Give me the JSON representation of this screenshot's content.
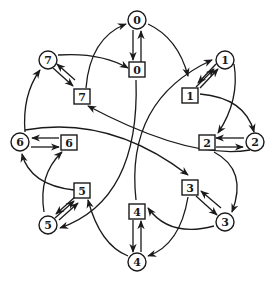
{
  "diagram": {
    "type": "state-transition-graph",
    "circle_nodes": [
      {
        "id": "c0",
        "label": "0"
      },
      {
        "id": "c1",
        "label": "1"
      },
      {
        "id": "c2",
        "label": "2"
      },
      {
        "id": "c3",
        "label": "3"
      },
      {
        "id": "c4",
        "label": "4"
      },
      {
        "id": "c5",
        "label": "5"
      },
      {
        "id": "c6",
        "label": "6"
      },
      {
        "id": "c7",
        "label": "7"
      }
    ],
    "square_nodes": [
      {
        "id": "s0",
        "label": "0"
      },
      {
        "id": "s1",
        "label": "1"
      },
      {
        "id": "s2",
        "label": "2"
      },
      {
        "id": "s3",
        "label": "3"
      },
      {
        "id": "s4",
        "label": "4"
      },
      {
        "id": "s5",
        "label": "5"
      },
      {
        "id": "s6",
        "label": "6"
      },
      {
        "id": "s7",
        "label": "7"
      }
    ],
    "edges": [
      {
        "from": "c0",
        "to": "s0"
      },
      {
        "from": "s0",
        "to": "c0"
      },
      {
        "from": "c1",
        "to": "s1"
      },
      {
        "from": "s1",
        "to": "c1"
      },
      {
        "from": "c2",
        "to": "s2"
      },
      {
        "from": "s2",
        "to": "c2"
      },
      {
        "from": "c3",
        "to": "s3"
      },
      {
        "from": "s3",
        "to": "c3"
      },
      {
        "from": "c4",
        "to": "s4"
      },
      {
        "from": "s4",
        "to": "c4"
      },
      {
        "from": "c5",
        "to": "s5"
      },
      {
        "from": "s5",
        "to": "c5"
      },
      {
        "from": "c6",
        "to": "s6"
      },
      {
        "from": "s6",
        "to": "c6"
      },
      {
        "from": "c7",
        "to": "s7"
      },
      {
        "from": "s7",
        "to": "c7"
      },
      {
        "from": "c0",
        "to": "s1"
      },
      {
        "from": "s7",
        "to": "c0"
      },
      {
        "from": "c7",
        "to": "s0"
      },
      {
        "from": "c1",
        "to": "s2"
      },
      {
        "from": "s1",
        "to": "c2"
      },
      {
        "from": "s2",
        "to": "c3"
      },
      {
        "from": "c3",
        "to": "s4"
      },
      {
        "from": "s3",
        "to": "c4"
      },
      {
        "from": "c4",
        "to": "s5"
      },
      {
        "from": "s5",
        "to": "c6"
      },
      {
        "from": "c5",
        "to": "s6"
      },
      {
        "from": "c6",
        "to": "s7"
      },
      {
        "from": "s0",
        "to": "c5"
      },
      {
        "from": "s4",
        "to": "c1"
      },
      {
        "from": "c2",
        "to": "s7"
      },
      {
        "from": "s6",
        "to": "s3"
      }
    ]
  }
}
